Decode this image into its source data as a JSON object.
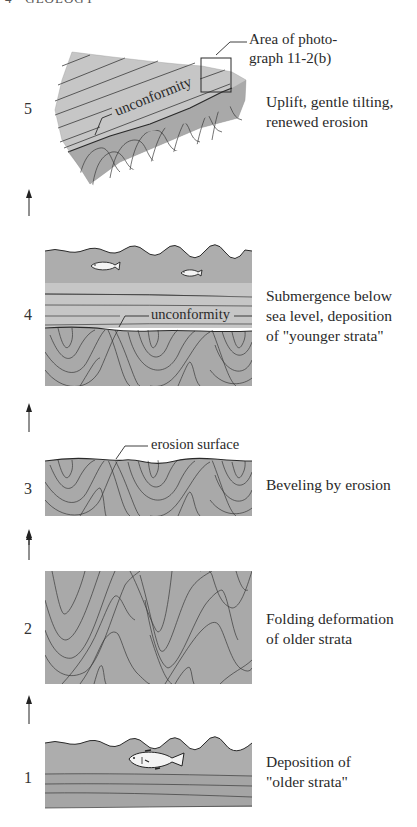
{
  "page": {
    "header": "GEOLOGY",
    "header_prefix": "4"
  },
  "figure": {
    "colors": {
      "folded_strata": "#a9a9a9",
      "younger_strata": "#c6c6c6",
      "water": "#adadad",
      "line": "#3a3a3a",
      "fish": "#f4f4f4"
    },
    "stages": [
      {
        "number": "5",
        "caption": "Uplift, gentle tilting,\nrenewed erosion",
        "callouts": {
          "unconformity": "unconformity",
          "photo_area": "Area of photo-\ngraph 11-2(b)"
        }
      },
      {
        "number": "4",
        "caption": "Submergence below\nsea level, deposition\nof \"younger strata\"",
        "callouts": {
          "unconformity": "unconformity"
        }
      },
      {
        "number": "3",
        "caption": "Beveling by erosion",
        "callouts": {
          "erosion_surface": "erosion surface"
        }
      },
      {
        "number": "2",
        "caption": "Folding deformation\nof older strata"
      },
      {
        "number": "1",
        "caption": "Deposition of\n\"older strata\""
      }
    ],
    "arrow_icon": "up-arrow-icon"
  }
}
